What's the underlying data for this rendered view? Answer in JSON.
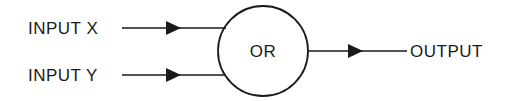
{
  "diagram": {
    "type": "logic-gate",
    "gate": {
      "label": "OR",
      "shape": "circle"
    },
    "inputs": [
      {
        "label": "INPUT X"
      },
      {
        "label": "INPUT Y"
      }
    ],
    "output": {
      "label": "OUTPUT"
    },
    "colors": {
      "stroke": "#1a1a1a",
      "background": "#ffffff"
    }
  }
}
